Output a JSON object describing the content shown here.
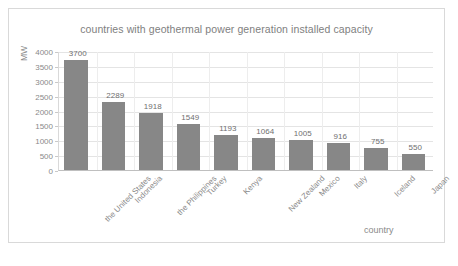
{
  "chart_data": {
    "type": "bar",
    "title": "countries with geothermal power generation installed capacity",
    "xlabel": "country",
    "ylabel": "MW",
    "categories": [
      "the United States",
      "Indonesia",
      "the Philippines",
      "Turkey",
      "Kenya",
      "New Zealand",
      "Mexico",
      "Italy",
      "Iceland",
      "Japan"
    ],
    "values": [
      3700,
      2289,
      1918,
      1549,
      1193,
      1064,
      1005,
      916,
      755,
      550
    ],
    "data_labels": [
      "3700",
      "2289",
      "1918",
      "1549",
      "1193",
      "1064",
      "1005",
      "916",
      "755",
      "550"
    ],
    "ylim": [
      0,
      4000
    ],
    "ytick_values": [
      0,
      500,
      1000,
      1500,
      2000,
      2500,
      3000,
      3500,
      4000
    ],
    "ytick_labels": [
      "0",
      "500",
      "1000",
      "1500",
      "2000",
      "2500",
      "3000",
      "3500",
      "4000"
    ],
    "grid": true,
    "legend": false,
    "series_color": "#878787",
    "gridline_color": "#e4e4e4",
    "text_color": "#808080"
  }
}
